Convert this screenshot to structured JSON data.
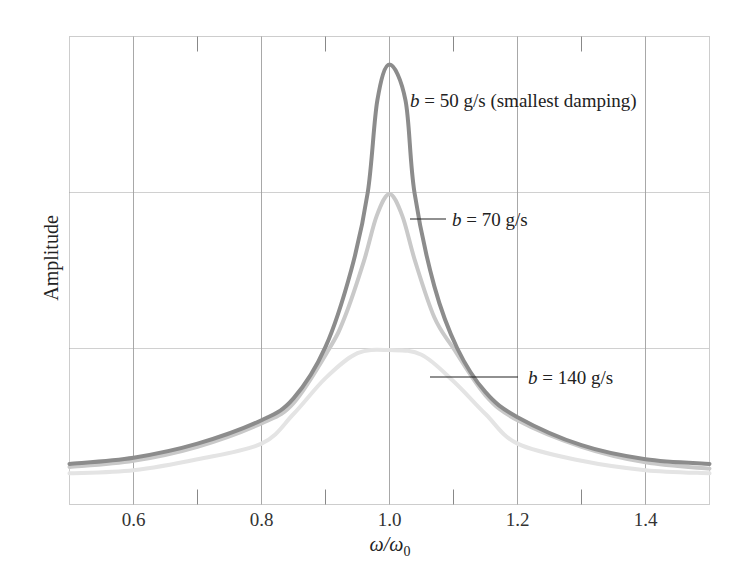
{
  "chart_data": {
    "type": "line",
    "title": "",
    "xlabel": "ω/ω₀",
    "ylabel": "Amplitude",
    "xlim": [
      0.5,
      1.5
    ],
    "ylim": [
      0,
      3
    ],
    "x_ticks": [
      0.6,
      0.8,
      1.0,
      1.2,
      1.4
    ],
    "x_tick_labels": [
      "0.6",
      "0.8",
      "1.0",
      "1.2",
      "1.4"
    ],
    "x_minor_ticks": [
      0.7,
      0.9,
      1.1,
      1.3
    ],
    "y_ticks_labeled": false,
    "y_gridlines": [
      1,
      2
    ],
    "grid": true,
    "legend": "inline annotations",
    "series": [
      {
        "name": "b = 50 g/s (smallest damping)",
        "b_value": "50 g/s",
        "color": "#8c8c8c",
        "x": [
          0.5,
          0.6,
          0.7,
          0.8,
          0.85,
          0.9,
          0.94,
          0.966,
          0.981,
          1.0,
          1.025,
          1.039,
          1.07,
          1.106,
          1.15,
          1.2,
          1.3,
          1.4,
          1.5
        ],
        "values": [
          0.26,
          0.3,
          0.39,
          0.54,
          0.68,
          1.01,
          1.5,
          2.0,
          2.59,
          2.82,
          2.59,
          2.0,
          1.4,
          1.0,
          0.72,
          0.56,
          0.38,
          0.29,
          0.26
        ]
      },
      {
        "name": "b = 70 g/s",
        "b_value": "70 g/s",
        "color": "#c9c9c9",
        "x": [
          0.5,
          0.6,
          0.7,
          0.8,
          0.85,
          0.906,
          0.93,
          0.96,
          0.98,
          1.0,
          1.02,
          1.04,
          1.07,
          1.1,
          1.15,
          1.2,
          1.3,
          1.4,
          1.5
        ],
        "values": [
          0.24,
          0.28,
          0.37,
          0.52,
          0.65,
          1.0,
          1.2,
          1.56,
          1.85,
          1.99,
          1.85,
          1.56,
          1.2,
          1.0,
          0.7,
          0.54,
          0.37,
          0.27,
          0.23
        ]
      },
      {
        "name": "b = 140 g/s",
        "b_value": "140 g/s",
        "color": "#e4e4e4",
        "x": [
          0.5,
          0.6,
          0.7,
          0.8,
          0.85,
          0.9,
          0.95,
          1.0,
          1.05,
          1.1,
          1.15,
          1.2,
          1.3,
          1.4,
          1.5
        ],
        "values": [
          0.2,
          0.22,
          0.29,
          0.39,
          0.58,
          0.81,
          0.97,
          0.99,
          0.96,
          0.79,
          0.58,
          0.39,
          0.28,
          0.22,
          0.2
        ]
      }
    ],
    "annotations": [
      {
        "prefix": "b",
        "text": " = 50 g/s (smallest damping)",
        "x_px": 410,
        "y_px": 107
      },
      {
        "prefix": "b",
        "text": " = 70 g/s",
        "x_px": 452,
        "y_px": 226,
        "leader": [
          410,
          219,
          446,
          219
        ]
      },
      {
        "prefix": "b",
        "text": " = 140 g/s",
        "x_px": 528,
        "y_px": 384,
        "leader": [
          430,
          377,
          518,
          377
        ]
      }
    ]
  },
  "labels": {
    "ylabel": "Amplitude",
    "xlabel_main": "ω/ω",
    "xlabel_sub": "0"
  }
}
